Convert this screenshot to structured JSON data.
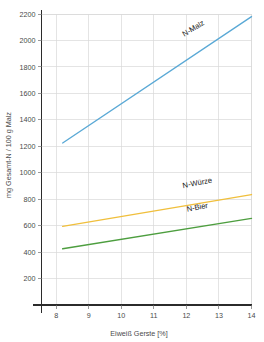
{
  "chart_data": {
    "type": "line",
    "title": "",
    "subtitle": "",
    "xlabel": "Eiweiß Gerste [%]",
    "ylabel": "mg Gesamt-N / 100 g Malz",
    "xlim": [
      7.55,
      14.0
    ],
    "ylim": [
      0,
      2290
    ],
    "xticks": [
      8,
      9,
      10,
      11,
      12,
      13,
      14
    ],
    "xtick_labels": [
      "8",
      "9",
      "10",
      "11",
      "12",
      "13",
      "14"
    ],
    "yticks": [
      200,
      400,
      600,
      800,
      1000,
      1200,
      1400,
      1600,
      1800,
      2000,
      2200
    ],
    "ytick_labels": [
      "200",
      "400",
      "600",
      "800",
      "1000",
      "1200",
      "1400",
      "1600",
      "1800",
      "2000",
      "2200"
    ],
    "grid": true,
    "grid_color": "#d9d9d9",
    "legend": "inline-line-labels",
    "legend_position": "on-plot",
    "background_color": "#ffffff",
    "x": [
      8.2,
      14.0
    ],
    "series": [
      {
        "name": "N-Malz",
        "color": "#5aa9d6",
        "values": [
          1225,
          2180
        ],
        "label_x": 12.25,
        "label_y": 2075,
        "label_rotation": -31
      },
      {
        "name": "N-Würze",
        "color": "#f0bf3c",
        "values": [
          595,
          835
        ],
        "label_x": 12.35,
        "label_y": 905,
        "label_rotation": -11
      },
      {
        "name": "N-Bier",
        "color": "#4d9e3f",
        "values": [
          425,
          655
        ],
        "label_x": 12.35,
        "label_y": 720,
        "label_rotation": -11
      }
    ]
  },
  "axes": {
    "y_title": "mg Gesamt-N / 100 g Malz",
    "x_title": "Eiweiß Gerste [%]"
  }
}
